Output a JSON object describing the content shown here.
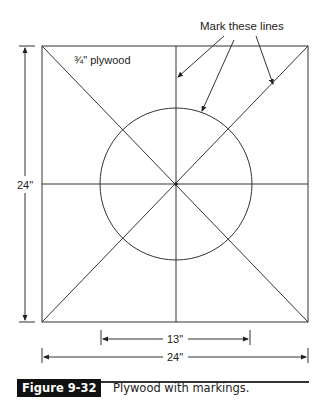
{
  "figure": {
    "material_label": "¾\" plywood",
    "callout_label": "Mark these lines",
    "height_dimension": "24\"",
    "width_dimension": "24\"",
    "circle_dimension": "13\"",
    "caption": {
      "number": "Figure 9-32",
      "text": "Plywood with markings."
    }
  },
  "colors": {
    "line": "#333333",
    "caption_bg": "#111111",
    "caption_fg": "#ffffff"
  }
}
